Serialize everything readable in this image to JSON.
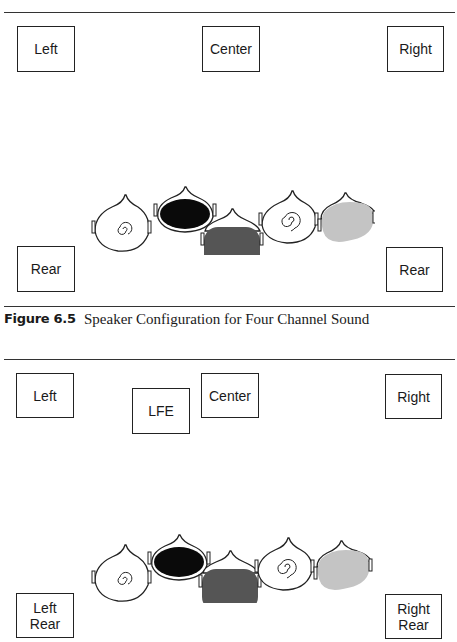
{
  "figures": [
    {
      "id": "fig-6-5",
      "caption_number": "Figure 6.5",
      "caption_text": "Speaker Configuration for Four Channel Sound",
      "speakers": {
        "left": "Left",
        "center": "Center",
        "right": "Right",
        "rear_left": "Rear",
        "rear_right": "Rear"
      },
      "listeners": [
        "head-spiral-small",
        "head-black",
        "head-dark-gray",
        "head-spiral-large",
        "head-light-gray"
      ]
    },
    {
      "id": "fig-6-6",
      "speakers": {
        "left": "Left",
        "lfe": "LFE",
        "center": "Center",
        "right": "Right",
        "rear_left": "Left\nRear",
        "rear_right": "Right\nRear"
      },
      "listeners": [
        "head-spiral-small",
        "head-black",
        "head-dark-gray",
        "head-spiral-large",
        "head-light-gray"
      ]
    }
  ],
  "colors": {
    "black_fill": "#0a0a0a",
    "dark_gray_fill": "#555555",
    "light_gray_fill": "#c4c4c4",
    "line": "#222222"
  }
}
